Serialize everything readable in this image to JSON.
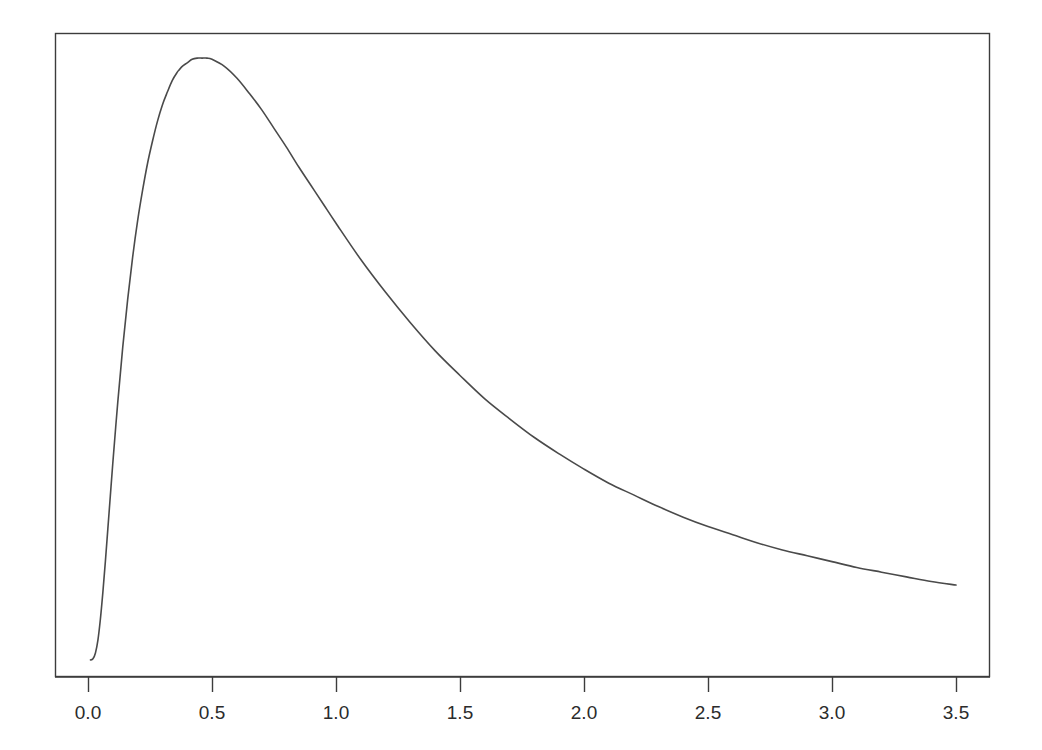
{
  "figure": {
    "background_color": "#ffffff",
    "frame_color": "#3c3c3c",
    "curve_color": "#4a4a4a",
    "tick_color": "#3c3c3c",
    "label_color": "#2b2b2b"
  },
  "chart_data": {
    "type": "line",
    "title": "",
    "subtitle": "",
    "xlabel": "",
    "ylabel": "",
    "legend": [],
    "grid": false,
    "legend_position": "none",
    "xlim": [
      -0.133,
      3.633
    ],
    "ylim": [
      0,
      0.685
    ],
    "xticks": [
      0.0,
      0.5,
      1.0,
      1.5,
      2.0,
      2.5,
      3.0,
      3.5
    ],
    "xticklabels": [
      "0.0",
      "0.5",
      "1.0",
      "1.5",
      "2.0",
      "2.5",
      "3.0",
      "3.5"
    ],
    "yticks": [],
    "yticklabels": [],
    "series": [
      {
        "name": "density",
        "x": [
          0.01,
          0.02,
          0.03,
          0.04,
          0.05,
          0.06,
          0.07,
          0.08,
          0.09,
          0.1,
          0.12,
          0.14,
          0.16,
          0.18,
          0.2,
          0.22,
          0.24,
          0.26,
          0.28,
          0.3,
          0.32,
          0.34,
          0.36,
          0.368,
          0.38,
          0.4,
          0.42,
          0.44,
          0.46,
          0.48,
          0.5,
          0.55,
          0.6,
          0.65,
          0.7,
          0.75,
          0.8,
          0.85,
          0.9,
          0.95,
          1.0,
          1.1,
          1.2,
          1.3,
          1.4,
          1.5,
          1.6,
          1.7,
          1.8,
          1.9,
          2.0,
          2.1,
          2.2,
          2.3,
          2.4,
          2.5,
          2.6,
          2.7,
          2.8,
          2.9,
          3.0,
          3.1,
          3.2,
          3.3,
          3.4,
          3.5
        ],
        "y": [
          0.0,
          0.001,
          0.006,
          0.017,
          0.035,
          0.058,
          0.084,
          0.112,
          0.14,
          0.168,
          0.22,
          0.267,
          0.308,
          0.344,
          0.375,
          0.401,
          0.424,
          0.443,
          0.46,
          0.474,
          0.485,
          0.495,
          0.502,
          0.504,
          0.507,
          0.51,
          0.513,
          0.514,
          0.514,
          0.514,
          0.513,
          0.507,
          0.497,
          0.484,
          0.47,
          0.454,
          0.438,
          0.421,
          0.405,
          0.389,
          0.373,
          0.342,
          0.314,
          0.288,
          0.264,
          0.243,
          0.223,
          0.206,
          0.19,
          0.176,
          0.163,
          0.151,
          0.141,
          0.131,
          0.122,
          0.114,
          0.107,
          0.1,
          0.094,
          0.089,
          0.084,
          0.079,
          0.075,
          0.071,
          0.067,
          0.064
        ]
      }
    ],
    "peak": {
      "x": 0.368,
      "y": 0.514
    },
    "annotations": []
  }
}
